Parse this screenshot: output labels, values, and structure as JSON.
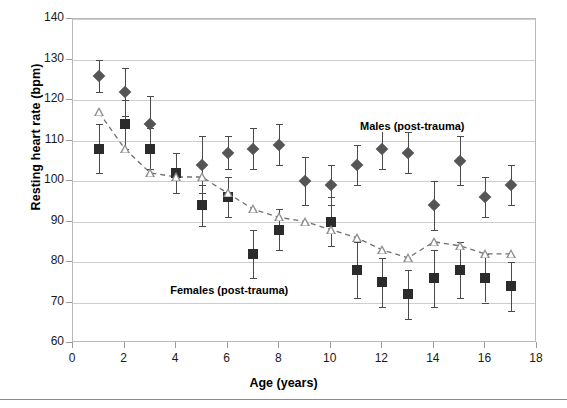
{
  "chart_data": {
    "type": "scatter",
    "title": "",
    "xlabel": "Age (years)",
    "ylabel": "Resting heart rate (bpm)",
    "xlim": [
      0,
      18
    ],
    "ylim": [
      60,
      140
    ],
    "xticks": [
      0,
      2,
      4,
      6,
      8,
      10,
      12,
      14,
      16,
      18
    ],
    "yticks": [
      60,
      70,
      80,
      90,
      100,
      110,
      120,
      130,
      140
    ],
    "grid": "horizontal",
    "legend_position": "inline-annotations",
    "annotations": [
      {
        "text": "Males (post-trauma)",
        "x": 13.2,
        "y": 113
      },
      {
        "text": "Females (post-trauma)",
        "x": 6.1,
        "y": 72.5
      }
    ],
    "series": [
      {
        "name": "Males (post-trauma)",
        "marker": "diamond",
        "color": "#555555",
        "x": [
          1,
          2,
          3,
          5,
          6,
          7,
          8,
          9,
          10,
          11,
          12,
          13,
          14,
          15,
          16,
          17
        ],
        "values": [
          126,
          122,
          114,
          104,
          107,
          108,
          109,
          100,
          99,
          104,
          108,
          107,
          94,
          105,
          96,
          99
        ],
        "errors": [
          4,
          6,
          7,
          7,
          4,
          5,
          5,
          6,
          5,
          5,
          5,
          5,
          6,
          6,
          5,
          5
        ]
      },
      {
        "name": "Females (post-trauma)",
        "marker": "square",
        "color": "#2b2b2b",
        "x": [
          1,
          2,
          3,
          4,
          5,
          6,
          7,
          8,
          10,
          11,
          12,
          13,
          14,
          15,
          16,
          17
        ],
        "values": [
          108,
          114,
          108,
          102,
          94,
          96,
          82,
          88,
          90,
          78,
          75,
          72,
          76,
          78,
          76,
          74
        ],
        "errors": [
          6,
          6,
          5,
          5,
          5,
          5,
          6,
          5,
          6,
          7,
          6,
          6,
          7,
          7,
          6,
          6
        ]
      },
      {
        "name": "Trend (dashed)",
        "marker": "triangle-open",
        "color": "#8d8d8d",
        "line": "dashed",
        "x": [
          1,
          2,
          3,
          4,
          5,
          6,
          7,
          8,
          9,
          10,
          11,
          12,
          13,
          14,
          15,
          16,
          17
        ],
        "values": [
          117,
          108,
          102,
          101,
          101,
          97,
          93,
          91,
          90,
          88,
          86,
          83,
          81,
          85,
          84,
          82,
          82
        ],
        "errors": [
          2,
          2,
          2,
          2,
          2,
          2,
          2,
          2,
          2,
          2,
          2,
          2,
          2,
          2,
          2,
          2,
          2
        ]
      }
    ]
  }
}
